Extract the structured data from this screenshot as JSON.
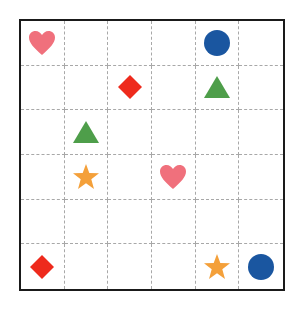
{
  "grid": {
    "rows": 6,
    "cols": 6,
    "items": [
      {
        "row": 0,
        "col": 0,
        "shape": "heart",
        "color": "#f0707c"
      },
      {
        "row": 0,
        "col": 4,
        "shape": "circle",
        "color": "#1a56a0"
      },
      {
        "row": 1,
        "col": 2,
        "shape": "diamond",
        "color": "#ee2a1c"
      },
      {
        "row": 1,
        "col": 4,
        "shape": "triangle",
        "color": "#4e9e4a"
      },
      {
        "row": 2,
        "col": 1,
        "shape": "triangle",
        "color": "#4e9e4a"
      },
      {
        "row": 3,
        "col": 1,
        "shape": "star",
        "color": "#f4a03a"
      },
      {
        "row": 3,
        "col": 3,
        "shape": "heart",
        "color": "#f0707c"
      },
      {
        "row": 5,
        "col": 0,
        "shape": "diamond",
        "color": "#ee2a1c"
      },
      {
        "row": 5,
        "col": 4,
        "shape": "star",
        "color": "#f4a03a"
      },
      {
        "row": 5,
        "col": 5,
        "shape": "circle",
        "color": "#1a56a0"
      }
    ]
  }
}
